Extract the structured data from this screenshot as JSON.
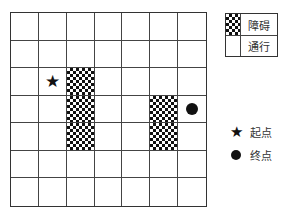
{
  "grid": {
    "rows": 7,
    "cols": 7,
    "obstacles": [
      [
        2,
        2
      ],
      [
        3,
        2
      ],
      [
        4,
        2
      ],
      [
        3,
        5
      ],
      [
        4,
        5
      ]
    ],
    "start": [
      2,
      1
    ],
    "end": [
      3,
      6
    ]
  },
  "legend": {
    "obstacle_label": "障碍",
    "passable_label": "通行",
    "start_label": "起点",
    "end_label": "终点"
  },
  "icons": {
    "start": "star-icon",
    "end": "filled-circle-icon"
  },
  "colors": {
    "line": "#444444",
    "fill": "#111111",
    "background": "#ffffff"
  }
}
